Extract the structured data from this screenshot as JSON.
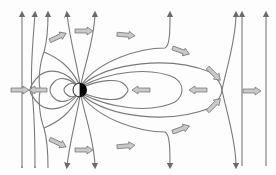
{
  "diagram": {
    "title": "",
    "colors": {
      "field_line": "#7a7a7a",
      "arrow_fill": "#c9c9c9",
      "arrow_stroke": "#6b6b6b",
      "dipole_dark": "#000000",
      "dipole_light": "#ffffff",
      "background": "#fdfdfd"
    },
    "dipole": {
      "cx": 80,
      "cy": 90,
      "r": 7
    },
    "null_point": {
      "x": 222,
      "y": 90
    },
    "vertical_field_lines_x": [
      22,
      35,
      48,
      67,
      95,
      242,
      266
    ],
    "flow_arrows": [
      {
        "x": 58,
        "y": 37,
        "angle": -25
      },
      {
        "x": 84,
        "y": 31,
        "angle": 0
      },
      {
        "x": 126,
        "y": 35,
        "angle": 5
      },
      {
        "x": 181,
        "y": 51,
        "angle": 20
      },
      {
        "x": 214,
        "y": 74,
        "angle": 45
      },
      {
        "x": 20,
        "y": 90,
        "angle": 0
      },
      {
        "x": 38,
        "y": 90,
        "angle": 180
      },
      {
        "x": 141,
        "y": 90,
        "angle": 180
      },
      {
        "x": 198,
        "y": 90,
        "angle": 180
      },
      {
        "x": 252,
        "y": 91,
        "angle": 0
      },
      {
        "x": 214,
        "y": 105,
        "angle": -45
      },
      {
        "x": 181,
        "y": 129,
        "angle": -20
      },
      {
        "x": 126,
        "y": 146,
        "angle": -5
      },
      {
        "x": 84,
        "y": 150,
        "angle": 0
      },
      {
        "x": 58,
        "y": 143,
        "angle": 25
      }
    ]
  }
}
